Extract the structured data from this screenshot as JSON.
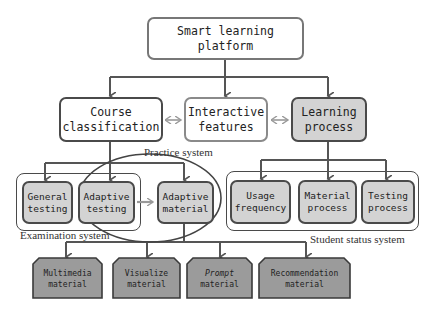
{
  "root": {
    "label": "Smart learning platform"
  },
  "level2": [
    {
      "label": "Course classification",
      "line1": "Course",
      "line2": "classification"
    },
    {
      "label": "Interactive features",
      "line1": "Interactive",
      "line2": "features"
    },
    {
      "label": "Learning process",
      "line1": "Learning",
      "line2": "process"
    }
  ],
  "groups": {
    "examination": {
      "caption": "Examination system"
    },
    "practice": {
      "caption": "Practice system"
    },
    "student_status": {
      "caption": "Student status system"
    }
  },
  "testing_nodes": [
    {
      "line1": "General",
      "line2": "testing"
    },
    {
      "line1": "Adaptive",
      "line2": "testing"
    },
    {
      "line1": "Adaptive",
      "line2": "material"
    }
  ],
  "status_nodes": [
    {
      "line1": "Usage",
      "line2": "frequency"
    },
    {
      "line1": "Material",
      "line2": "process"
    },
    {
      "line1": "Testing",
      "line2": "process"
    }
  ],
  "material_nodes": [
    {
      "line1": "Multimedia",
      "line2": "material"
    },
    {
      "line1": "Visualize",
      "line2": "material"
    },
    {
      "line1": "Prompt",
      "line2": "material"
    },
    {
      "line1": "Recommendation",
      "line2": "material"
    }
  ],
  "colors": {
    "line": "#555555",
    "light_fill": "#d3d3d3",
    "dark_fill": "#9b9b9b",
    "bidirectional_arrow": "#9a9a9a"
  }
}
